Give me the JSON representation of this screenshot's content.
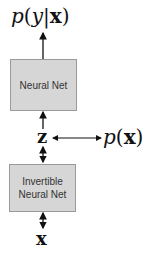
{
  "diagram": {
    "top_output_label": {
      "p": "p",
      "open": "(",
      "y": "y",
      "bar": "|",
      "x": "x",
      "close": ")"
    },
    "top_box": {
      "label": "Neural Net"
    },
    "latent": {
      "label": "z"
    },
    "density_label": {
      "p": "p",
      "open": "(",
      "x": "x",
      "close": ")"
    },
    "bottom_box": {
      "line1": "Invertible",
      "line2": "Neural Net"
    },
    "input": {
      "label": "x"
    },
    "colors": {
      "box_fill": "#d6d6d6",
      "box_border": "#9a9a9a",
      "arrow": "#111111"
    }
  }
}
